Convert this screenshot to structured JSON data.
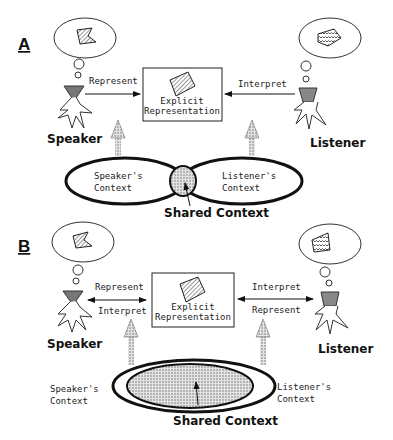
{
  "panels": {
    "a": {
      "label": "A",
      "left_arrow_label": "Represent",
      "right_arrow_label": "Interpret",
      "box_line1": "Explicit",
      "box_line2": "Representation",
      "speaker": "Speaker",
      "listener": "Listener",
      "speaker_context_1": "Speaker's",
      "speaker_context_2": "Context",
      "listener_context_1": "Listener's",
      "listener_context_2": "Context",
      "shared_context": "Shared Context"
    },
    "b": {
      "label": "B",
      "left_top_label": "Represent",
      "left_bottom_label": "Interpret",
      "right_top_label": "Interpret",
      "right_bottom_label": "Represent",
      "box_line1": "Explicit",
      "box_line2": "Representation",
      "speaker": "Speaker",
      "listener": "Listener",
      "speaker_context_1": "Speaker's",
      "speaker_context_2": "Context",
      "listener_context_1": "Listener's",
      "listener_context_2": "Context",
      "shared_context": "Shared Context"
    }
  },
  "colors": {
    "line": "#111111",
    "head_speaker": "#777777",
    "head_listener": "#888888",
    "dots": "#9a9a9a"
  }
}
